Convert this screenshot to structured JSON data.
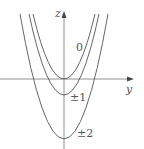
{
  "diagram": {
    "axes": {
      "vertical_label": "z",
      "horizontal_label": "y"
    },
    "curves": [
      {
        "label": "0",
        "vertex_z": 0
      },
      {
        "label": "±1",
        "vertex_z": -1
      },
      {
        "label": "±2",
        "vertex_z": -4
      }
    ],
    "colors": {
      "curve": "#555555",
      "axis": "#777777"
    }
  }
}
